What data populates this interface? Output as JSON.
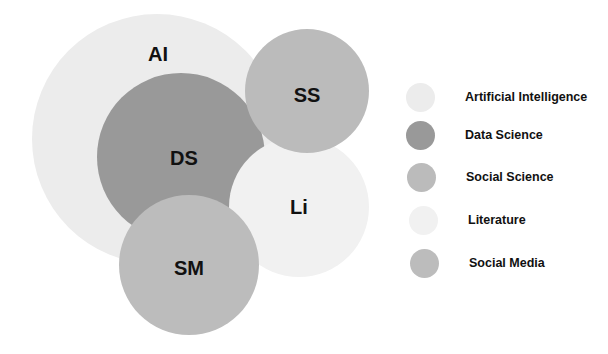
{
  "diagram": {
    "type": "overlapping-circles",
    "circles": [
      {
        "id": "ai",
        "label": "AI",
        "name": "Artificial Intelligence",
        "cx": 157,
        "cy": 139,
        "r": 125,
        "color": "#ececec",
        "label_x": 158,
        "label_y": 54
      },
      {
        "id": "ds",
        "label": "DS",
        "name": "Data Science",
        "cx": 181,
        "cy": 157,
        "r": 84,
        "color": "#999999",
        "label_x": 184,
        "label_y": 158
      },
      {
        "id": "li",
        "label": "Li",
        "name": "Literature",
        "cx": 299,
        "cy": 207,
        "r": 70,
        "color": "#f1f1f1",
        "label_x": 299,
        "label_y": 207
      },
      {
        "id": "ss",
        "label": "SS",
        "name": "Social Science",
        "cx": 307,
        "cy": 91,
        "r": 62,
        "color": "#bbbbbb",
        "label_x": 307,
        "label_y": 95
      },
      {
        "id": "sm",
        "label": "SM",
        "name": "Social Media",
        "cx": 189,
        "cy": 265,
        "r": 70,
        "color": "#bcbcbc",
        "label_x": 189,
        "label_y": 268
      }
    ]
  },
  "legend": {
    "items": [
      {
        "label": "Artificial Intelligence",
        "color": "#ececec",
        "x": 406,
        "y": 97
      },
      {
        "label": "Data Science",
        "color": "#999999",
        "x": 406,
        "y": 135
      },
      {
        "label": "Social Science",
        "color": "#bbbbbb",
        "x": 407,
        "y": 177
      },
      {
        "label": "Literature",
        "color": "#f1f1f1",
        "x": 409,
        "y": 220
      },
      {
        "label": "Social Media",
        "color": "#bcbcbc",
        "x": 410,
        "y": 263
      }
    ]
  }
}
